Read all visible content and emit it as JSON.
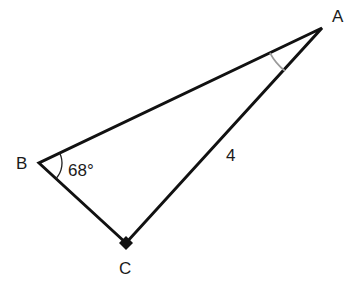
{
  "diagram": {
    "type": "right-triangle",
    "vertices": {
      "A": {
        "label": "A",
        "x": 322,
        "y": 28
      },
      "B": {
        "label": "B",
        "x": 39,
        "y": 163
      },
      "C": {
        "label": "C",
        "x": 126,
        "y": 243
      }
    },
    "right_angle_at": "C",
    "angle_B_label": "68°",
    "side_AC_label": "4",
    "angle_A_marked": true,
    "colors": {
      "line": "#111111",
      "arc_A": "#9a9a9a",
      "arc_B": "#222222"
    }
  }
}
